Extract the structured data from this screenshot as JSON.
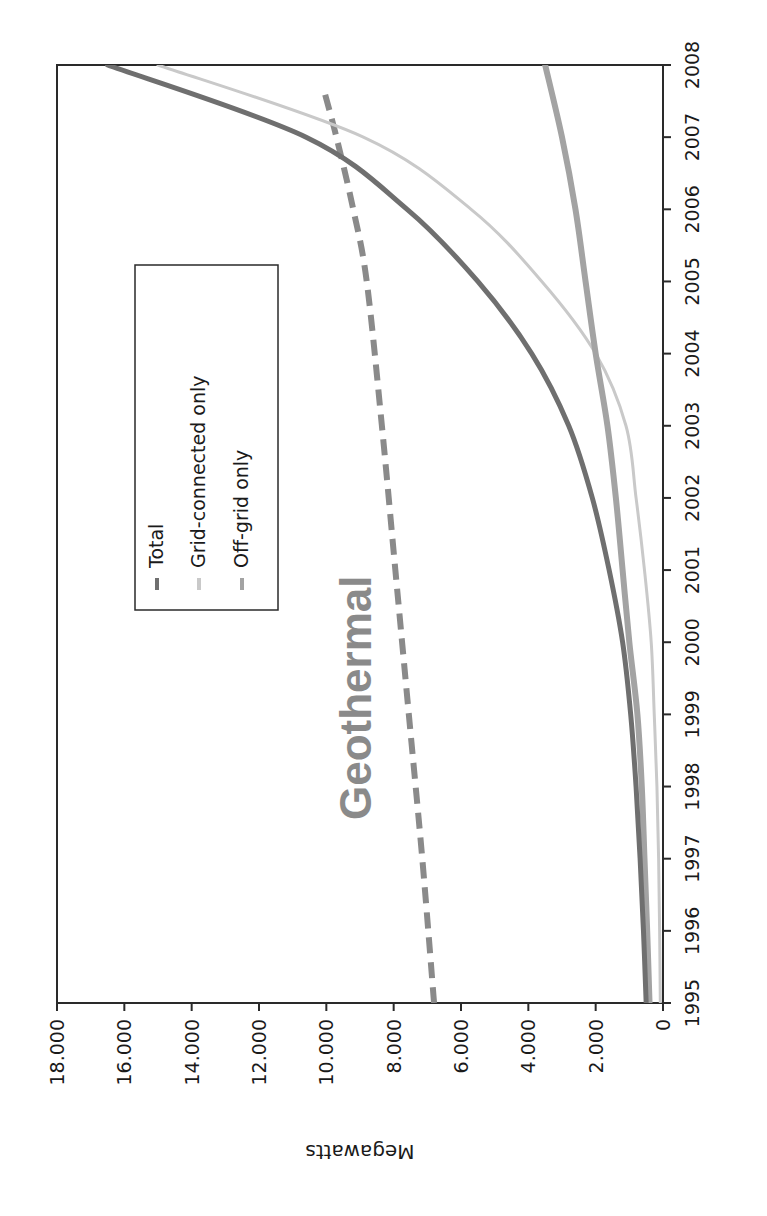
{
  "chart_data": {
    "type": "line",
    "title": "",
    "orientation_note": "figure rendered rotated 90 degrees clockwise",
    "xlabel": "",
    "ylabel": "Megawatts",
    "x": [
      1995,
      1996,
      1997,
      1998,
      1999,
      2000,
      2001,
      2002,
      2003,
      2004,
      2005,
      2006,
      2007,
      2008
    ],
    "x_tick_labels": [
      "1995",
      "1996",
      "1997",
      "1998",
      "1999",
      "2000",
      "2001",
      "2002",
      "2003",
      "2004",
      "2005",
      "2006",
      "2007",
      "2008"
    ],
    "y_tick_labels": [
      "0",
      "2.000",
      "4.000",
      "6.000",
      "8.000",
      "10.000",
      "12.000",
      "14.000",
      "16.000",
      "18.000"
    ],
    "y_ticks": [
      0,
      2000,
      4000,
      6000,
      8000,
      10000,
      12000,
      14000,
      16000,
      18000
    ],
    "ylim": [
      0,
      18000
    ],
    "grid": false,
    "legend_position": "upper-left inside plot",
    "series": [
      {
        "name": "Total",
        "color": "#6f6f6f",
        "width": 5,
        "dash": "",
        "values": [
          500,
          580,
          680,
          800,
          960,
          1200,
          1600,
          2100,
          2800,
          3900,
          5500,
          7600,
          10600,
          16500
        ]
      },
      {
        "name": "Grid-connected only",
        "color": "#c9c9c9",
        "width": 3,
        "dash": "",
        "values": [
          80,
          100,
          130,
          180,
          260,
          350,
          550,
          800,
          1100,
          2000,
          3600,
          5700,
          8900,
          15000
        ]
      },
      {
        "name": "Off-grid only",
        "color": "#a3a3a3",
        "width": 6,
        "dash": "",
        "values": [
          400,
          470,
          550,
          630,
          760,
          1000,
          1200,
          1400,
          1650,
          2000,
          2300,
          2600,
          3000,
          3500
        ]
      }
    ],
    "annotations": [
      {
        "text": "Geothermal",
        "type": "dashed-reference-line",
        "color": "#8a8a8a",
        "x": [
          1995,
          1997,
          1999,
          2001,
          2003,
          2005,
          2006,
          2007,
          2007.7
        ],
        "values": [
          6800,
          7150,
          7550,
          7950,
          8350,
          8800,
          9200,
          9700,
          10100
        ]
      }
    ]
  },
  "legend": {
    "items": [
      {
        "label": "Total",
        "color": "#6f6f6f"
      },
      {
        "label": "Grid-connected only",
        "color": "#c9c9c9"
      },
      {
        "label": "Off-grid only",
        "color": "#a3a3a3"
      }
    ]
  },
  "annotation_label": "Geothermal",
  "axis_title": "Megawatts"
}
